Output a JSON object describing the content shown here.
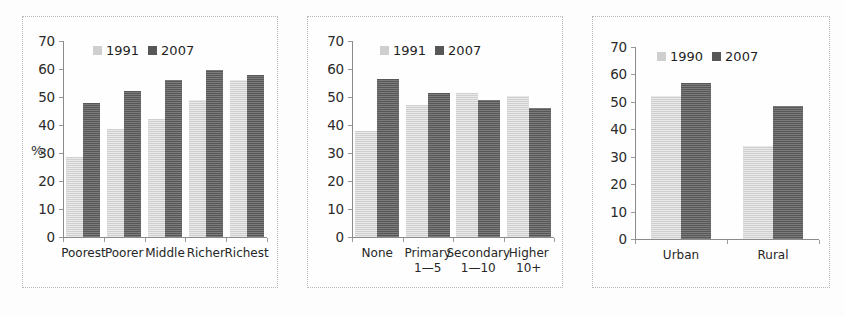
{
  "colors": {
    "series_light": "#cfcfcf",
    "series_dark": "#575757",
    "axis": "#8b8b8b",
    "text": "#262626",
    "panel_border": "#b9b9b9",
    "background": "#fdfdfd"
  },
  "chart_data": [
    {
      "type": "bar",
      "title": "",
      "xlabel": "",
      "ylabel": "%",
      "ylim": [
        0,
        70
      ],
      "yticks": [
        0,
        10,
        20,
        30,
        40,
        50,
        60,
        70
      ],
      "ytick_labels": [
        "0",
        "10",
        "20",
        "30",
        "40",
        "50",
        "60",
        "70"
      ],
      "grid": false,
      "legend_position": "top-center",
      "categories": [
        "Poorest",
        "Poorer",
        "Middle",
        "Richer",
        "Richest"
      ],
      "category_sublabels": [
        "",
        "",
        "",
        "",
        ""
      ],
      "series": [
        {
          "name": "1991",
          "values": [
            28.5,
            38.5,
            42.0,
            49.0,
            56.0
          ]
        },
        {
          "name": "2007",
          "values": [
            48.0,
            52.0,
            56.0,
            59.5,
            58.0
          ]
        }
      ]
    },
    {
      "type": "bar",
      "title": "",
      "xlabel": "",
      "ylabel": "",
      "ylim": [
        0,
        70
      ],
      "yticks": [
        0,
        10,
        20,
        30,
        40,
        50,
        60,
        70
      ],
      "ytick_labels": [
        "0",
        "10",
        "20",
        "30",
        "40",
        "50",
        "60",
        "70"
      ],
      "grid": false,
      "legend_position": "top-center",
      "categories": [
        "None",
        "Primary",
        "Secondary",
        "Higher"
      ],
      "category_sublabels": [
        "",
        "1—5",
        "1—10",
        "10+"
      ],
      "series": [
        {
          "name": "1991",
          "values": [
            38.0,
            47.0,
            51.5,
            50.5
          ]
        },
        {
          "name": "2007",
          "values": [
            56.5,
            51.5,
            49.0,
            46.0
          ]
        }
      ]
    },
    {
      "type": "bar",
      "title": "",
      "xlabel": "",
      "ylabel": "",
      "ylim": [
        0,
        70
      ],
      "yticks": [
        0,
        10,
        20,
        30,
        40,
        50,
        60,
        70
      ],
      "ytick_labels": [
        "0",
        "10",
        "20",
        "30",
        "40",
        "50",
        "60",
        "70"
      ],
      "grid": false,
      "legend_position": "top-center",
      "categories": [
        "Urban",
        "Rural"
      ],
      "category_sublabels": [
        "",
        ""
      ],
      "series": [
        {
          "name": "1990",
          "values": [
            52.0,
            34.0
          ]
        },
        {
          "name": "2007",
          "values": [
            57.0,
            48.5
          ]
        }
      ]
    }
  ],
  "layout": [
    {
      "plot_left": 40,
      "plot_right": 244,
      "plot_top": 24,
      "plot_bottom": 220,
      "legend_left": 70,
      "legend_top": 26,
      "ylabel_left": 8,
      "ylabel_top": 126,
      "bar_width": 17,
      "bar_gap": 0,
      "label_line_height": 13
    },
    {
      "plot_left": 44,
      "plot_right": 246,
      "plot_top": 24,
      "plot_bottom": 220,
      "legend_left": 72,
      "legend_top": 26,
      "ylabel_left": 8,
      "ylabel_top": 126,
      "bar_width": 22,
      "bar_gap": 0,
      "label_line_height": 13
    },
    {
      "plot_left": 42,
      "plot_right": 226,
      "plot_top": 30,
      "plot_bottom": 222,
      "legend_left": 64,
      "legend_top": 32,
      "ylabel_left": 8,
      "ylabel_top": 126,
      "bar_width": 30,
      "bar_gap": 0,
      "label_line_height": 13
    }
  ]
}
